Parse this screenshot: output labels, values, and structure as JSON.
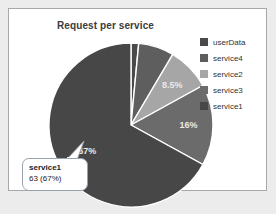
{
  "panel": {
    "background": "#ffffff",
    "border_color": "#a8a8a8",
    "page_background": "#ececed"
  },
  "title": "Request per service",
  "legend": {
    "position": "right",
    "items": [
      {
        "label": "userData",
        "color": "#4a4a4a",
        "swatch": "legend-swatch-userdata"
      },
      {
        "label": "service4",
        "color": "#5e5e5e",
        "swatch": "legend-swatch-service4"
      },
      {
        "label": "service2",
        "color": "#a6a6a6",
        "swatch": "legend-swatch-service2"
      },
      {
        "label": "service3",
        "color": "#6b6b6b",
        "swatch": "legend-swatch-service3"
      },
      {
        "label": "service1",
        "color": "#474747",
        "swatch": "legend-swatch-service1"
      }
    ]
  },
  "tooltip": {
    "title": "service1",
    "value": "63 (67%)",
    "border_color": "#9aa3ad",
    "background": "#ffffff"
  },
  "slice_labels": {
    "service2": "8.5%",
    "service3": "16%",
    "service1": "67%"
  },
  "chart_data": {
    "type": "pie",
    "title": "Request per service",
    "categories": [
      "userData",
      "service4",
      "service2",
      "service3",
      "service1"
    ],
    "values": [
      1.5,
      7.0,
      8.5,
      16.0,
      67.0
    ],
    "value_unit": "percent",
    "counts": {
      "service1": 63
    },
    "colors": [
      "#4a4a4a",
      "#5e5e5e",
      "#a6a6a6",
      "#6b6b6b",
      "#474747"
    ],
    "labels_shown": [
      "",
      "",
      "8.5%",
      "16%",
      "67%"
    ],
    "start_angle_deg": 0,
    "direction": "clockwise",
    "slice_border_color": "#ffffff",
    "legend_position": "right",
    "highlighted_slice": "service1",
    "highlight_text": "service1 63 (67%)"
  }
}
